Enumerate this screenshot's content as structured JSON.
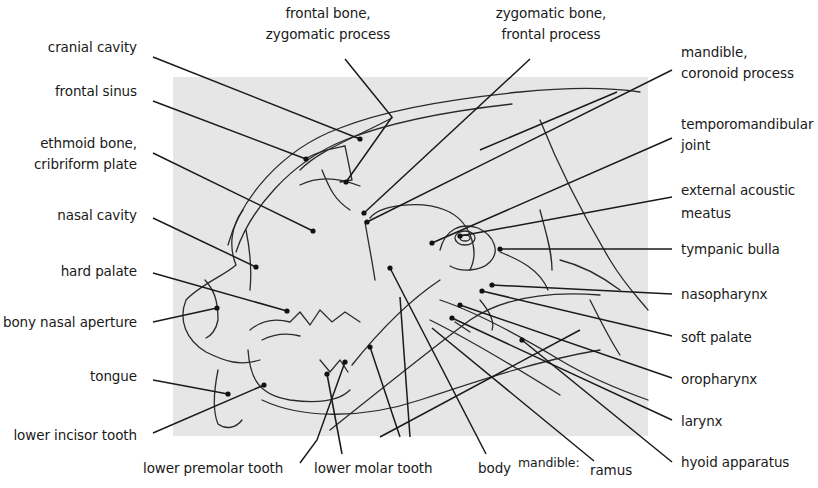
{
  "diagram": {
    "panel_color": "#e6e6e6",
    "line_color": "#1a1a1a"
  },
  "labels_left": [
    {
      "id": "cranial-cavity",
      "lines": [
        "cranial cavity"
      ]
    },
    {
      "id": "frontal-sinus",
      "lines": [
        "frontal sinus"
      ]
    },
    {
      "id": "ethmoid-bone",
      "lines": [
        "ethmoid bone,",
        "cribriform plate"
      ]
    },
    {
      "id": "nasal-cavity",
      "lines": [
        "nasal cavity"
      ]
    },
    {
      "id": "hard-palate",
      "lines": [
        "hard palate"
      ]
    },
    {
      "id": "bony-nasal-aperture",
      "lines": [
        "bony nasal aperture"
      ]
    },
    {
      "id": "tongue",
      "lines": [
        "tongue"
      ]
    },
    {
      "id": "lower-incisor-tooth",
      "lines": [
        "lower incisor tooth"
      ]
    }
  ],
  "labels_top": [
    {
      "id": "frontal-bone",
      "lines": [
        "frontal bone,",
        "zygomatic process"
      ]
    },
    {
      "id": "zygomatic-bone",
      "lines": [
        "zygomatic bone,",
        "frontal process"
      ]
    }
  ],
  "labels_right": [
    {
      "id": "mandible-coronoid",
      "lines": [
        "mandible,",
        "coronoid process"
      ]
    },
    {
      "id": "temporomandibular-joint",
      "lines": [
        "temporomandibular",
        "joint"
      ]
    },
    {
      "id": "external-acoustic-meatus",
      "lines": [
        "external acoustic",
        "meatus"
      ]
    },
    {
      "id": "tympanic-bulla",
      "lines": [
        "tympanic bulla"
      ]
    },
    {
      "id": "nasopharynx",
      "lines": [
        "nasopharynx"
      ]
    },
    {
      "id": "soft-palate",
      "lines": [
        "soft palate"
      ]
    },
    {
      "id": "oropharynx",
      "lines": [
        "oropharynx"
      ]
    },
    {
      "id": "larynx",
      "lines": [
        "larynx"
      ]
    },
    {
      "id": "hyoid-apparatus",
      "lines": [
        "hyoid apparatus"
      ]
    }
  ],
  "labels_bottom": [
    {
      "id": "lower-premolar-tooth",
      "lines": [
        "lower premolar tooth"
      ]
    },
    {
      "id": "lower-molar-tooth",
      "lines": [
        "lower molar tooth"
      ]
    },
    {
      "id": "mandible-body",
      "lines": [
        "body"
      ]
    },
    {
      "id": "mandible-group",
      "lines": [
        "mandible:"
      ]
    },
    {
      "id": "mandible-ramus",
      "lines": [
        "ramus"
      ]
    }
  ]
}
